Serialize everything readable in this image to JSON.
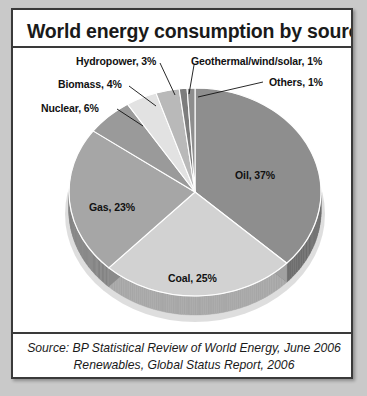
{
  "card": {
    "title": "World energy consumption by source"
  },
  "source": {
    "line1": "Source:  BP Statistical Review of World Energy, June 2006",
    "line2": "Renewables, Global Status Report, 2006"
  },
  "chart_data": {
    "type": "pie",
    "title": "World energy consumption by source",
    "style": "3d-pie",
    "start_angle_deg": 0,
    "direction": "clockwise",
    "categories": [
      "Oil",
      "Coal",
      "Gas",
      "Nuclear",
      "Biomass",
      "Hydropower",
      "Geothermal/wind/solar",
      "Others"
    ],
    "values": [
      37,
      25,
      23,
      6,
      4,
      3,
      1,
      1
    ],
    "unit": "%",
    "total": 100,
    "legend_position": "none",
    "grid": false,
    "slices": [
      {
        "name": "Oil",
        "value": 37,
        "label": "Oil, 37%",
        "color": "#8e8e8e",
        "side_color": "#6f6f6f",
        "label_placement": "inside",
        "label_x": 222,
        "label_y": 159
      },
      {
        "name": "Coal",
        "value": 25,
        "label": "Coal, 25%",
        "color": "#d2d2d2",
        "side_color": "#a8a8a8",
        "label_placement": "inside",
        "label_x": 155,
        "label_y": 262
      },
      {
        "name": "Gas",
        "value": 23,
        "label": "Gas, 23%",
        "color": "#a6a6a6",
        "side_color": "#858585",
        "label_placement": "inside",
        "label_x": 76,
        "label_y": 191
      },
      {
        "name": "Nuclear",
        "value": 6,
        "label": "Nuclear, 6%",
        "color": "#9a9a9a",
        "side_color": "#7c7c7c",
        "label_placement": "callout",
        "label_x": 28,
        "label_y": 92,
        "leader": {
          "x1": 104,
          "y1": 99,
          "x2": 130,
          "y2": 116
        }
      },
      {
        "name": "Biomass",
        "value": 4,
        "label": "Biomass, 4%",
        "color": "#e2e2e2",
        "side_color": "#b6b6b6",
        "label_placement": "callout",
        "label_x": 45,
        "label_y": 68,
        "leader": {
          "x1": 116,
          "y1": 76,
          "x2": 143,
          "y2": 96
        }
      },
      {
        "name": "Hydropower",
        "value": 3,
        "label": "Hydropower, 3%",
        "color": "#b9b9b9",
        "side_color": "#949494",
        "label_placement": "callout",
        "label_x": 63,
        "label_y": 45,
        "leader": {
          "x1": 147,
          "y1": 53,
          "x2": 162,
          "y2": 85
        }
      },
      {
        "name": "Geothermal/wind/solar",
        "value": 1,
        "label": "Geothermal/wind/solar, 1%",
        "color": "#7d7d7d",
        "side_color": "#666666",
        "label_placement": "callout",
        "label_x": 178,
        "label_y": 45,
        "leader": {
          "x1": 181,
          "y1": 55,
          "x2": 176,
          "y2": 84
        }
      },
      {
        "name": "Others",
        "value": 1,
        "label": "Others, 1%",
        "color": "#8e8e8e",
        "side_color": "#6f6f6f",
        "label_placement": "callout",
        "label_x": 256,
        "label_y": 66,
        "leader": {
          "x1": 185,
          "y1": 87,
          "x2": 250,
          "y2": 72
        }
      }
    ],
    "geometry": {
      "center_x": 182,
      "center_y": 182,
      "radius_x": 126,
      "radius_y": 104,
      "depth": 19
    }
  }
}
